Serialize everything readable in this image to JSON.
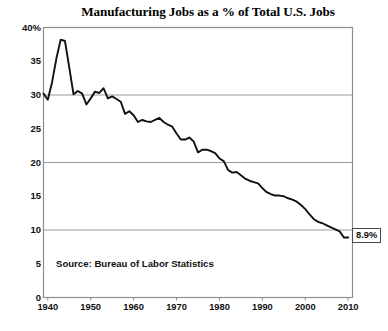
{
  "chart_data": {
    "type": "line",
    "title": "Manufacturing Jobs as a % of Total U.S. Jobs",
    "xlabel": "",
    "ylabel": "",
    "ylim": [
      0,
      40
    ],
    "xlim": [
      1939,
      2011
    ],
    "grid": "horizontal gridlines at 10, 20, 30",
    "legend": "none",
    "source_note": "Source: Bureau of Labor Statistics",
    "y_ticks": [
      "0",
      "5",
      "10",
      "15",
      "20",
      "25",
      "30",
      "35",
      "40%"
    ],
    "y_tick_values": [
      0,
      5,
      10,
      15,
      20,
      25,
      30,
      35,
      40
    ],
    "x_ticks": [
      "1940",
      "1950",
      "1960",
      "1970",
      "1980",
      "1990",
      "2000",
      "2010"
    ],
    "x_tick_values": [
      1940,
      1950,
      1960,
      1970,
      1980,
      1990,
      2000,
      2010
    ],
    "gridline_values": [
      10,
      20,
      30
    ],
    "annotations": [
      {
        "label": "8.9%",
        "x": 2010,
        "y": 8.9,
        "kind": "end-value-callout"
      }
    ],
    "series": [
      {
        "name": "Manufacturing share of total U.S. jobs",
        "color": "#111111",
        "x": [
          1939,
          1940,
          1941,
          1942,
          1943,
          1944,
          1945,
          1946,
          1947,
          1948,
          1949,
          1950,
          1951,
          1952,
          1953,
          1954,
          1955,
          1956,
          1957,
          1958,
          1959,
          1960,
          1961,
          1962,
          1963,
          1964,
          1965,
          1966,
          1967,
          1968,
          1969,
          1970,
          1971,
          1972,
          1973,
          1974,
          1975,
          1976,
          1977,
          1978,
          1979,
          1980,
          1981,
          1982,
          1983,
          1984,
          1985,
          1986,
          1987,
          1988,
          1989,
          1990,
          1991,
          1992,
          1993,
          1994,
          1995,
          1996,
          1997,
          1998,
          1999,
          2000,
          2001,
          2002,
          2003,
          2004,
          2005,
          2006,
          2007,
          2008,
          2009,
          2010
        ],
        "values": [
          30.2,
          29.3,
          31.9,
          35.4,
          38.2,
          38.0,
          34.1,
          30.1,
          30.6,
          30.2,
          28.6,
          29.5,
          30.5,
          30.3,
          31.0,
          29.5,
          29.8,
          29.4,
          29.0,
          27.2,
          27.6,
          27.0,
          26.0,
          26.3,
          26.1,
          26.0,
          26.3,
          26.6,
          26.0,
          25.6,
          25.3,
          24.3,
          23.4,
          23.4,
          23.7,
          23.1,
          21.5,
          21.9,
          21.9,
          21.7,
          21.4,
          20.6,
          20.2,
          18.9,
          18.5,
          18.6,
          18.1,
          17.6,
          17.3,
          17.1,
          16.9,
          16.2,
          15.6,
          15.3,
          15.1,
          15.1,
          15.0,
          14.7,
          14.5,
          14.2,
          13.7,
          13.1,
          12.3,
          11.6,
          11.2,
          11.0,
          10.7,
          10.4,
          10.1,
          9.8,
          8.9,
          8.9
        ]
      }
    ]
  }
}
